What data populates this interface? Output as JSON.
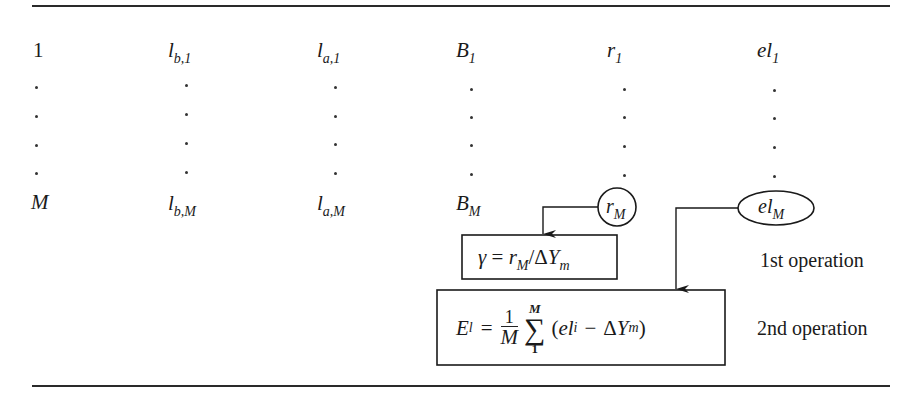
{
  "table": {
    "rows": [
      {
        "index": "1",
        "lb_base": "l",
        "lb_sub": "b,1",
        "la_base": "l",
        "la_sub": "a,1",
        "B_base": "B",
        "B_sub": "1",
        "r_base": "r",
        "r_sub": "1",
        "el_base": "el",
        "el_sub": "1"
      },
      {
        "index": "M",
        "lb_base": "l",
        "lb_sub": "b,M",
        "la_base": "l",
        "la_sub": "a,M",
        "B_base": "B",
        "B_sub": "M",
        "r_base": "r",
        "r_sub": "M",
        "el_base": "el",
        "el_sub": "M"
      }
    ],
    "ellipsis_rows": 4
  },
  "diagram": {
    "circle_node": {
      "base": "r",
      "sub": "M"
    },
    "ellipse_node": {
      "base": "el",
      "sub": "M"
    },
    "operation1": {
      "formula_lhs": "γ",
      "formula_eq": "=",
      "formula_r_base": "r",
      "formula_r_sub": "M",
      "formula_div": "/",
      "formula_delta": "Δ",
      "formula_Y_base": "Y",
      "formula_Y_sub": "m",
      "label": "1st operation"
    },
    "operation2": {
      "lhs_base": "E",
      "lhs_sub": "l",
      "eq": "=",
      "frac_num": "1",
      "frac_den": "M",
      "sum_upper": "M",
      "sum_symbol": "∑",
      "sum_lower": "1",
      "paren_open": "(",
      "el_base": "el",
      "el_sub": "i",
      "minus": "−",
      "delta": "Δ",
      "Y_base": "Y",
      "Y_sub": "m",
      "paren_close": ")",
      "label": "2nd operation"
    }
  },
  "colors": {
    "ink": "#1a1a1a",
    "paper": "#ffffff"
  }
}
